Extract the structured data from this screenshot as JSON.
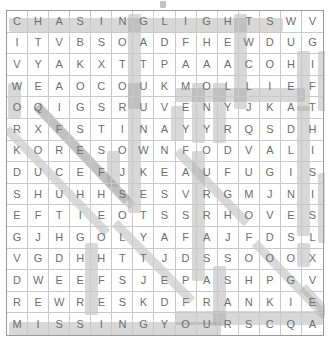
{
  "puzzle": {
    "kind": "word-search",
    "rows": 14,
    "cols": 15,
    "title_mark": "tick-mark",
    "grid": [
      [
        "C",
        "H",
        "A",
        "S",
        "I",
        "N",
        "G",
        "L",
        "I",
        "G",
        "H",
        "T",
        "S",
        "W",
        "V"
      ],
      [
        "I",
        "T",
        "V",
        "B",
        "S",
        "O",
        "A",
        "D",
        "F",
        "H",
        "E",
        "W",
        "D",
        "U",
        "G"
      ],
      [
        "V",
        "Y",
        "A",
        "K",
        "X",
        "T",
        "T",
        "P",
        "A",
        "A",
        "A",
        "C",
        "O",
        "H",
        "I"
      ],
      [
        "W",
        "E",
        "A",
        "O",
        "C",
        "O",
        "U",
        "K",
        "M",
        "O",
        "L",
        "L",
        "I",
        "E",
        "F"
      ],
      [
        "O",
        "Q",
        "I",
        "G",
        "S",
        "R",
        "U",
        "V",
        "E",
        "N",
        "Y",
        "J",
        "K",
        "A",
        "T"
      ],
      [
        "R",
        "X",
        "F",
        "S",
        "T",
        "I",
        "N",
        "A",
        "Y",
        "Y",
        "R",
        "Q",
        "S",
        "D",
        "H"
      ],
      [
        "K",
        "O",
        "R",
        "E",
        "S",
        "O",
        "W",
        "N",
        "F",
        "O",
        "D",
        "V",
        "A",
        "L",
        "I"
      ],
      [
        "D",
        "U",
        "C",
        "E",
        "F",
        "J",
        "K",
        "E",
        "A",
        "U",
        "F",
        "U",
        "G",
        "I",
        "S"
      ],
      [
        "S",
        "H",
        "U",
        "H",
        "H",
        "S",
        "E",
        "S",
        "V",
        "R",
        "G",
        "M",
        "J",
        "N",
        "I"
      ],
      [
        "E",
        "F",
        "T",
        "I",
        "E",
        "O",
        "T",
        "S",
        "S",
        "R",
        "H",
        "O",
        "V",
        "E",
        "S"
      ],
      [
        "G",
        "J",
        "H",
        "G",
        "O",
        "L",
        "Y",
        "A",
        "F",
        "A",
        "J",
        "F",
        "D",
        "S",
        "L"
      ],
      [
        "V",
        "G",
        "D",
        "H",
        "H",
        "T",
        "T",
        "J",
        "D",
        "S",
        "S",
        "O",
        "O",
        "O",
        "X"
      ],
      [
        "D",
        "W",
        "E",
        "E",
        "F",
        "S",
        "J",
        "E",
        "P",
        "A",
        "S",
        "H",
        "P",
        "G",
        "V"
      ],
      [
        "R",
        "E",
        "W",
        "R",
        "E",
        "S",
        "K",
        "D",
        "F",
        "R",
        "A",
        "N",
        "K",
        "I",
        "E"
      ],
      [
        "M",
        "I",
        "S",
        "S",
        "I",
        "N",
        "G",
        "Y",
        "O",
        "U",
        "R",
        "S",
        "C",
        "Q",
        "A"
      ]
    ],
    "found_words": [
      {
        "word": "CHASING LIGHTS",
        "orientation": "horizontal",
        "row": 0,
        "start_col": 0,
        "end_col": 12
      },
      {
        "word": "MOLLIE",
        "orientation": "horizontal",
        "row": 3,
        "start_col": 8,
        "end_col": 13
      },
      {
        "word": "FRANKIE",
        "orientation": "horizontal",
        "row": 13,
        "start_col": 8,
        "end_col": 14
      },
      {
        "word": "MISSING YOU",
        "orientation": "horizontal",
        "row": 14,
        "start_col": 0,
        "end_col": 9
      }
    ],
    "colors": {
      "highlight": "#9e9e9e",
      "grid_line": "#c9c9c9",
      "border": "#9a9a9a",
      "letter": "#6e6e6e",
      "background": "#ffffff"
    }
  }
}
